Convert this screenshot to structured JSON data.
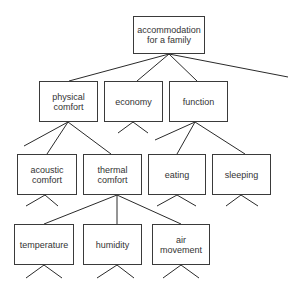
{
  "diagram": {
    "type": "tree",
    "title": "",
    "nodes": [
      {
        "id": "root",
        "label": "accommodation\nfor a family",
        "parent": null
      },
      {
        "id": "physical",
        "label": "physical\ncomfort",
        "parent": "root"
      },
      {
        "id": "economy",
        "label": "economy",
        "parent": "root"
      },
      {
        "id": "function",
        "label": "function",
        "parent": "root"
      },
      {
        "id": "acoustic",
        "label": "acoustic\ncomfort",
        "parent": "physical"
      },
      {
        "id": "thermal",
        "label": "thermal\ncomfort",
        "parent": "physical"
      },
      {
        "id": "eating",
        "label": "eating",
        "parent": "function"
      },
      {
        "id": "sleeping",
        "label": "sleeping",
        "parent": "function"
      },
      {
        "id": "temperature",
        "label": "temperature",
        "parent": "thermal"
      },
      {
        "id": "humidity",
        "label": "humidity",
        "parent": "thermal"
      },
      {
        "id": "air",
        "label": "air\nmovement",
        "parent": "thermal"
      }
    ],
    "line_color": "#2a2a2a"
  }
}
